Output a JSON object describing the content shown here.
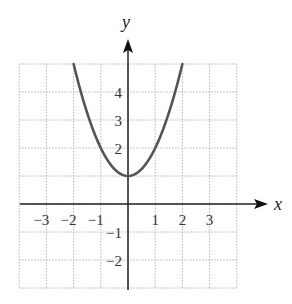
{
  "chart_data": {
    "type": "line",
    "title": "",
    "xlabel": "x",
    "ylabel": "y",
    "xlim": [
      -4,
      4
    ],
    "ylim": [
      -3,
      5
    ],
    "grid": true,
    "x_ticks": [
      "−3",
      "−2",
      "−1",
      "1",
      "2",
      "3"
    ],
    "x_tick_values": [
      -3,
      -2,
      -1,
      1,
      2,
      3
    ],
    "y_ticks": [
      "4",
      "3",
      "2",
      "−1",
      "−2"
    ],
    "y_tick_values": [
      4,
      3,
      2,
      -1,
      -2
    ],
    "series": [
      {
        "name": "y = x^2 + 1",
        "x": [
          -2,
          -1.5,
          -1,
          -0.5,
          0,
          0.5,
          1,
          1.5,
          2
        ],
        "values": [
          5,
          3.25,
          2,
          1.25,
          1,
          1.25,
          2,
          3.25,
          5
        ]
      }
    ],
    "colors": {
      "curve": "#555555",
      "grid": "#b5b5b5",
      "axis": "#222222"
    }
  }
}
